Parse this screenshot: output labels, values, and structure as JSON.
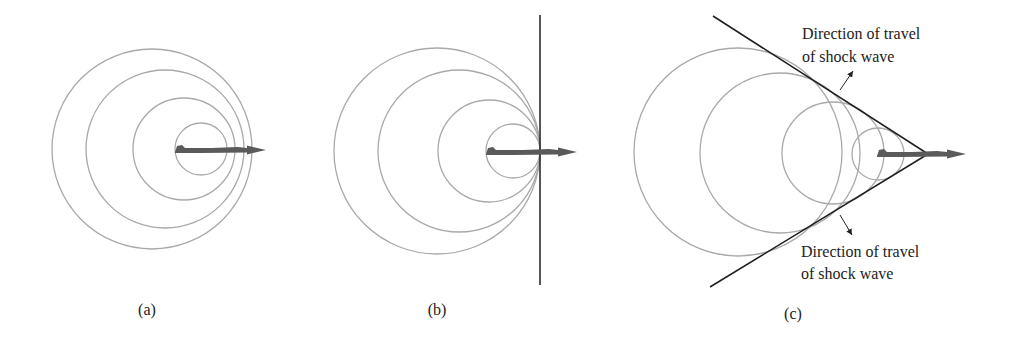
{
  "figure": {
    "colors": {
      "wavefront": "#a9a9a9",
      "shock_line": "#1e1e1e",
      "plane_arrow": "#5a5a5a",
      "text": "#222222"
    },
    "panels": [
      {
        "label": "(a)",
        "label_pos": [
          147,
          315
        ],
        "circles": [
          {
            "cx": 152,
            "cy": 149,
            "r": 100
          },
          {
            "cx": 165,
            "cy": 149,
            "r": 79
          },
          {
            "cx": 184,
            "cy": 149,
            "r": 51
          },
          {
            "cx": 201,
            "cy": 149,
            "r": 26
          }
        ],
        "plane": {
          "x0": 175,
          "x1": 266,
          "y": 150
        }
      },
      {
        "label": "(b)",
        "label_pos": [
          437,
          315
        ],
        "circles": [
          {
            "cx": 437,
            "cy": 151,
            "r": 103
          },
          {
            "cx": 459,
            "cy": 151,
            "r": 81
          },
          {
            "cx": 489,
            "cy": 151,
            "r": 51
          },
          {
            "cx": 513,
            "cy": 151,
            "r": 27
          }
        ],
        "plane": {
          "x0": 486,
          "x1": 577,
          "y": 152
        },
        "shock_line": {
          "x": 540,
          "y0": 15,
          "y1": 285
        }
      },
      {
        "label": "(c)",
        "label_pos": [
          793,
          319
        ],
        "circles": [
          {
            "cx": 738,
            "cy": 152,
            "r": 104
          },
          {
            "cx": 780,
            "cy": 153,
            "r": 80
          },
          {
            "cx": 833,
            "cy": 153,
            "r": 51
          },
          {
            "cx": 878,
            "cy": 154,
            "r": 26
          }
        ],
        "plane": {
          "x0": 877,
          "x1": 966,
          "y": 154
        },
        "shock_cone": {
          "apex": [
            928,
            154
          ],
          "upper_end": [
            713,
            16
          ],
          "lower_end": [
            710,
            287
          ]
        },
        "annotations": [
          {
            "line1": "Direction of travel",
            "line2": "of shock wave",
            "x": 802,
            "y1": 39,
            "y2": 62,
            "arrow": {
              "from": [
                840,
                90
              ],
              "to": [
                854,
                70
              ]
            }
          },
          {
            "line1": "Direction of travel",
            "line2": "of shock wave",
            "x": 801,
            "y1": 257,
            "y2": 278,
            "arrow": {
              "from": [
                840,
                215
              ],
              "to": [
                853,
                236
              ]
            }
          }
        ]
      }
    ]
  }
}
